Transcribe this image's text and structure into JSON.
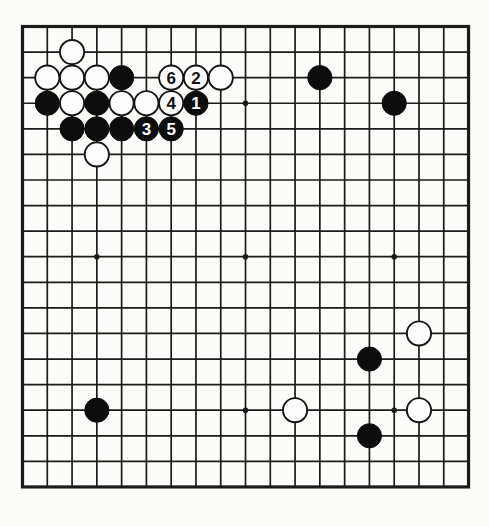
{
  "diagram": {
    "kind": "go-board-diagram",
    "board_size": 19,
    "colors": {
      "paper": "#fcfcfa",
      "line": "#1b1b1b",
      "black_stone": "#0d0d0d",
      "white_stone": "#fefefe",
      "white_stone_outline": "#141414",
      "label_on_black": "#ffffff",
      "label_on_white": "#111111"
    },
    "star_points": [
      {
        "col": 10,
        "row": 4
      },
      {
        "col": 4,
        "row": 10
      },
      {
        "col": 10,
        "row": 10
      },
      {
        "col": 16,
        "row": 10
      },
      {
        "col": 10,
        "row": 16
      },
      {
        "col": 16,
        "row": 16
      }
    ],
    "stones": [
      {
        "col": 3,
        "row": 2,
        "color": "white",
        "label": ""
      },
      {
        "col": 2,
        "row": 3,
        "color": "white",
        "label": ""
      },
      {
        "col": 3,
        "row": 3,
        "color": "white",
        "label": ""
      },
      {
        "col": 4,
        "row": 3,
        "color": "white",
        "label": ""
      },
      {
        "col": 5,
        "row": 3,
        "color": "black",
        "label": ""
      },
      {
        "col": 7,
        "row": 3,
        "color": "white",
        "label": "6"
      },
      {
        "col": 8,
        "row": 3,
        "color": "white",
        "label": "2"
      },
      {
        "col": 9,
        "row": 3,
        "color": "white",
        "label": ""
      },
      {
        "col": 13,
        "row": 3,
        "color": "black",
        "label": ""
      },
      {
        "col": 2,
        "row": 4,
        "color": "black",
        "label": ""
      },
      {
        "col": 3,
        "row": 4,
        "color": "white",
        "label": ""
      },
      {
        "col": 4,
        "row": 4,
        "color": "black",
        "label": ""
      },
      {
        "col": 5,
        "row": 4,
        "color": "white",
        "label": ""
      },
      {
        "col": 6,
        "row": 4,
        "color": "white",
        "label": ""
      },
      {
        "col": 7,
        "row": 4,
        "color": "white",
        "label": "4"
      },
      {
        "col": 8,
        "row": 4,
        "color": "black",
        "label": "1"
      },
      {
        "col": 16,
        "row": 4,
        "color": "black",
        "label": ""
      },
      {
        "col": 3,
        "row": 5,
        "color": "black",
        "label": ""
      },
      {
        "col": 4,
        "row": 5,
        "color": "black",
        "label": ""
      },
      {
        "col": 5,
        "row": 5,
        "color": "black",
        "label": ""
      },
      {
        "col": 6,
        "row": 5,
        "color": "black",
        "label": "3"
      },
      {
        "col": 7,
        "row": 5,
        "color": "black",
        "label": "5"
      },
      {
        "col": 4,
        "row": 6,
        "color": "white",
        "label": ""
      },
      {
        "col": 17,
        "row": 13,
        "color": "white",
        "label": ""
      },
      {
        "col": 15,
        "row": 14,
        "color": "black",
        "label": ""
      },
      {
        "col": 4,
        "row": 16,
        "color": "black",
        "label": ""
      },
      {
        "col": 12,
        "row": 16,
        "color": "white",
        "label": ""
      },
      {
        "col": 17,
        "row": 16,
        "color": "white",
        "label": ""
      },
      {
        "col": 15,
        "row": 17,
        "color": "black",
        "label": ""
      }
    ]
  }
}
